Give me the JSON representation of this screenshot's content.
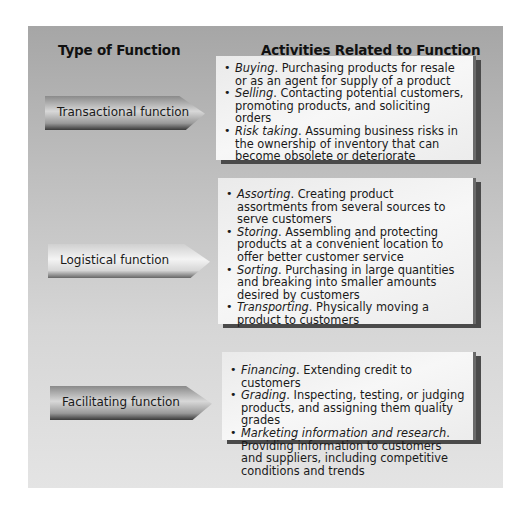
{
  "headers": {
    "left": "Type of Function",
    "right": "Activities Related to Function"
  },
  "rows": [
    {
      "function": "Transactional function",
      "activities": [
        {
          "term": "Buying",
          "desc": ". Purchasing products for resale or as an agent for supply of a product"
        },
        {
          "term": "Selling",
          "desc": ". Contacting potential customers, promoting products, and soliciting orders"
        },
        {
          "term": "Risk taking",
          "desc": ". Assuming business risks in the ownership of inventory that can become obsolete or deteriorate"
        }
      ]
    },
    {
      "function": "Logistical function",
      "activities": [
        {
          "term": "Assorting",
          "desc": ". Creating product assortments from several sources to serve customers"
        },
        {
          "term": "Storing",
          "desc": ". Assembling and protecting products at a convenient location to offer better customer service"
        },
        {
          "term": "Sorting",
          "desc": ". Purchasing in large quantities and breaking into smaller amounts desired by customers"
        },
        {
          "term": "Transporting",
          "desc": ". Physically moving a product to customers"
        }
      ]
    },
    {
      "function": "Facilitating function",
      "activities": [
        {
          "term": "Financing",
          "desc": ". Extending credit to customers"
        },
        {
          "term": "Grading",
          "desc": ". Inspecting, testing, or judging products, and assigning them quality grades"
        },
        {
          "term": "Marketing information and research",
          "desc": ". Providing information to customers and suppliers, including competitive conditions and trends"
        }
      ]
    }
  ]
}
